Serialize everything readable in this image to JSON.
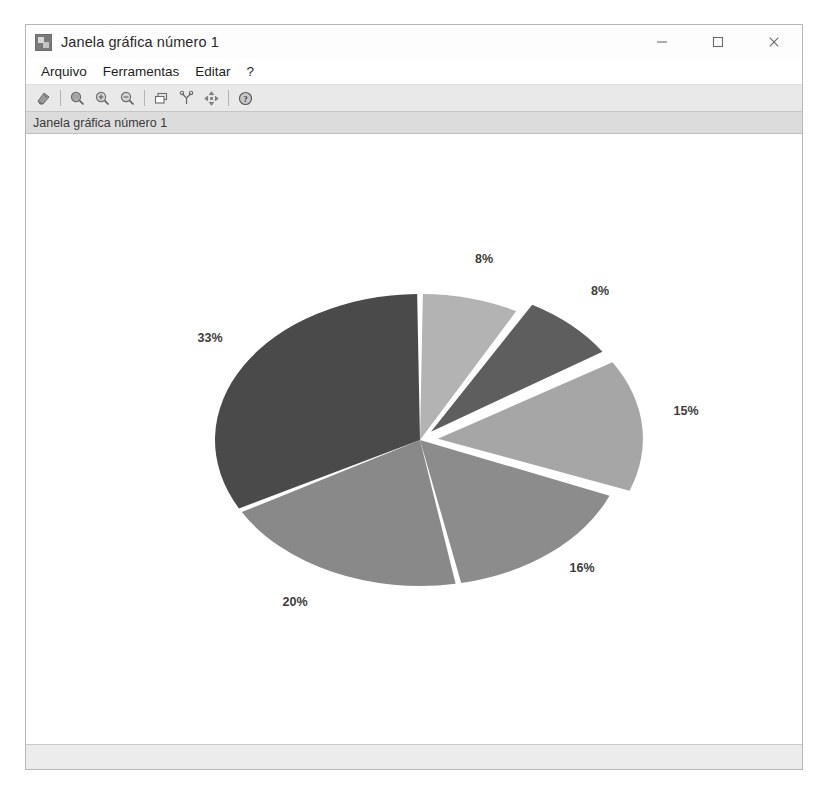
{
  "window": {
    "title": "Janela gráfica número 1",
    "app_icon": "graphics-window-icon",
    "controls": {
      "minimize": "minimize-icon",
      "maximize": "maximize-icon",
      "close": "close-icon"
    }
  },
  "menubar": {
    "items": [
      {
        "label": "Arquivo"
      },
      {
        "label": "Ferramentas"
      },
      {
        "label": "Editar"
      },
      {
        "label": "?"
      }
    ]
  },
  "toolbar": {
    "buttons": [
      {
        "name": "file-export-icon",
        "title": ""
      },
      {
        "name": "zoom-area-icon",
        "title": ""
      },
      {
        "name": "zoom-in-icon",
        "title": ""
      },
      {
        "name": "zoom-out-icon",
        "title": ""
      },
      {
        "name": "rotate-2d-icon",
        "title": ""
      },
      {
        "name": "rotate-3d-icon",
        "title": ""
      },
      {
        "name": "pan-move-icon",
        "title": ""
      },
      {
        "name": "help-icon",
        "title": ""
      }
    ]
  },
  "infobar": {
    "text": "Janela gráfica número 1"
  },
  "statusbar": {
    "text": ""
  },
  "chart_data": {
    "type": "pie",
    "title": "",
    "labels": [
      "8%",
      "8%",
      "15%",
      "16%",
      "20%",
      "33%"
    ],
    "values": [
      8,
      8,
      15,
      16,
      20,
      33
    ],
    "value_suffix": "%",
    "legend": "none",
    "grid": false,
    "start_angle_deg": -90,
    "direction": "clockwise",
    "center": {
      "x": 420,
      "y": 443
    },
    "radius": {
      "rx": 205,
      "ry": 146
    },
    "gap_deg": 1.6,
    "background": "#ffffff",
    "slices": [
      {
        "label": "8%",
        "value": 8,
        "color": "#b3b3b3",
        "exploded": false,
        "offset": 0,
        "label_x": 484,
        "label_y": 266
      },
      {
        "label": "8%",
        "value": 8,
        "color": "#5e5e5e",
        "exploded": true,
        "offset": 16,
        "label_x": 600,
        "label_y": 298
      },
      {
        "label": "15%",
        "value": 15,
        "color": "#a6a6a6",
        "exploded": true,
        "offset": 18,
        "label_x": 686,
        "label_y": 418
      },
      {
        "label": "16%",
        "value": 16,
        "color": "#8c8c8c",
        "exploded": false,
        "offset": 0,
        "label_x": 582,
        "label_y": 575
      },
      {
        "label": "20%",
        "value": 20,
        "color": "#898989",
        "exploded": false,
        "offset": 0,
        "label_x": 295,
        "label_y": 609
      },
      {
        "label": "33%",
        "value": 33,
        "color": "#4a4a4a",
        "exploded": false,
        "offset": 0,
        "label_x": 210,
        "label_y": 345
      }
    ]
  }
}
